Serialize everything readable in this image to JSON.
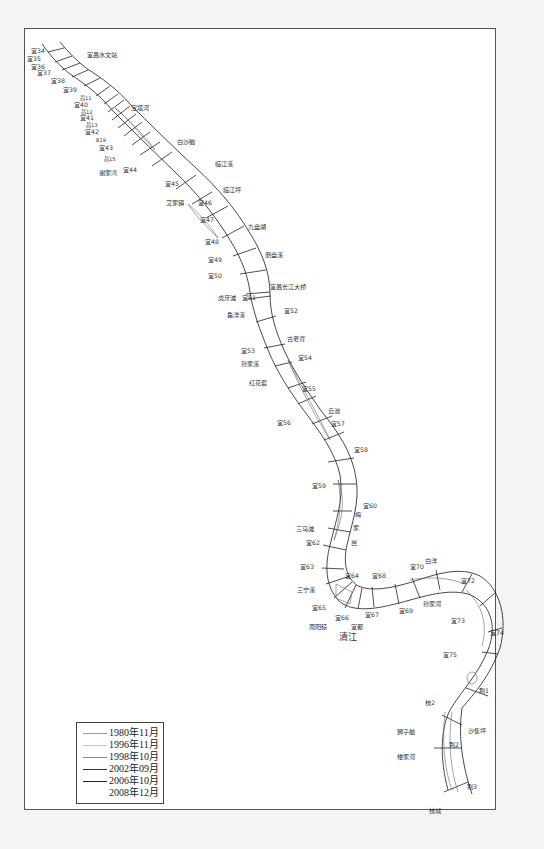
{
  "map": {
    "title": "",
    "frame_color": "#555555",
    "river_line_color": "#333333"
  },
  "sections": [
    {
      "id": "s34",
      "label": "宜34",
      "x": 31,
      "y": 53
    },
    {
      "id": "s35",
      "label": "宜35",
      "x": 27,
      "y": 61
    },
    {
      "id": "s36",
      "label": "宜36",
      "x": 31,
      "y": 69
    },
    {
      "id": "s37",
      "label": "宜37",
      "x": 37,
      "y": 75
    },
    {
      "id": "s38",
      "label": "宜38",
      "x": 51,
      "y": 83
    },
    {
      "id": "s39",
      "label": "宜39",
      "x": 63,
      "y": 92
    },
    {
      "id": "s40",
      "label": "宜40",
      "x": 74,
      "y": 107
    },
    {
      "id": "s41",
      "label": "宜41",
      "x": 80,
      "y": 120
    },
    {
      "id": "s42",
      "label": "宜42",
      "x": 85,
      "y": 134
    },
    {
      "id": "s43",
      "label": "宜43",
      "x": 99,
      "y": 150
    },
    {
      "id": "s44",
      "label": "宜44",
      "x": 123,
      "y": 172
    },
    {
      "id": "s45",
      "label": "宜45",
      "x": 165,
      "y": 186
    },
    {
      "id": "s46",
      "label": "宜46",
      "x": 198,
      "y": 205
    },
    {
      "id": "s47",
      "label": "宜47",
      "x": 200,
      "y": 222
    },
    {
      "id": "s48",
      "label": "宜48",
      "x": 205,
      "y": 244
    },
    {
      "id": "s49",
      "label": "宜49",
      "x": 208,
      "y": 262
    },
    {
      "id": "s50",
      "label": "宜50",
      "x": 208,
      "y": 278
    },
    {
      "id": "s51",
      "label": "宜51",
      "x": 242,
      "y": 300
    },
    {
      "id": "s52",
      "label": "宜52",
      "x": 284,
      "y": 313
    },
    {
      "id": "s53",
      "label": "宜53",
      "x": 241,
      "y": 353
    },
    {
      "id": "s54",
      "label": "宜54",
      "x": 298,
      "y": 360
    },
    {
      "id": "s55",
      "label": "宜55",
      "x": 302,
      "y": 391
    },
    {
      "id": "s56",
      "label": "宜56",
      "x": 277,
      "y": 425
    },
    {
      "id": "s57",
      "label": "宜57",
      "x": 331,
      "y": 426
    },
    {
      "id": "s58",
      "label": "宜58",
      "x": 354,
      "y": 452
    },
    {
      "id": "s59",
      "label": "宜59",
      "x": 312,
      "y": 488
    },
    {
      "id": "s60",
      "label": "宜60",
      "x": 363,
      "y": 508
    },
    {
      "id": "s62",
      "label": "宜62",
      "x": 306,
      "y": 545
    },
    {
      "id": "s63",
      "label": "宜63",
      "x": 300,
      "y": 569
    },
    {
      "id": "s64",
      "label": "宜64",
      "x": 345,
      "y": 578
    },
    {
      "id": "s65",
      "label": "宜65",
      "x": 312,
      "y": 610
    },
    {
      "id": "s66",
      "label": "宜66",
      "x": 335,
      "y": 620
    },
    {
      "id": "s67",
      "label": "宜67",
      "x": 365,
      "y": 617
    },
    {
      "id": "s68",
      "label": "宜68",
      "x": 372,
      "y": 578
    },
    {
      "id": "s69",
      "label": "宜69",
      "x": 399,
      "y": 613
    },
    {
      "id": "s70",
      "label": "宜70",
      "x": 410,
      "y": 569
    },
    {
      "id": "s72",
      "label": "宜72",
      "x": 461,
      "y": 583
    },
    {
      "id": "s73",
      "label": "宜73",
      "x": 451,
      "y": 623
    },
    {
      "id": "s74",
      "label": "宜74",
      "x": 490,
      "y": 635
    },
    {
      "id": "s75",
      "label": "宜75",
      "x": 443,
      "y": 657
    },
    {
      "id": "j1",
      "label": "荆1",
      "x": 479,
      "y": 693
    },
    {
      "id": "z2",
      "label": "枝2",
      "x": 425,
      "y": 705
    },
    {
      "id": "j2",
      "label": "荆2",
      "x": 449,
      "y": 747
    },
    {
      "id": "j3",
      "label": "荆3",
      "x": 467,
      "y": 789
    }
  ],
  "small_sections": [
    {
      "label": "昌11",
      "x": 80,
      "y": 100
    },
    {
      "label": "昌12",
      "x": 81,
      "y": 114
    },
    {
      "label": "昌13",
      "x": 86,
      "y": 127
    },
    {
      "label": "昌15",
      "x": 104,
      "y": 161
    },
    {
      "label": "B19",
      "x": 96,
      "y": 142
    }
  ],
  "places": [
    {
      "label": "宜昌水文站",
      "x": 87,
      "y": 57
    },
    {
      "label": "宝塔河",
      "x": 131,
      "y": 110
    },
    {
      "label": "白沙脑",
      "x": 177,
      "y": 144
    },
    {
      "label": "谢家湾",
      "x": 99,
      "y": 175
    },
    {
      "label": "临江溪",
      "x": 215,
      "y": 166
    },
    {
      "label": "临江坪",
      "x": 223,
      "y": 192
    },
    {
      "label": "艾家镇",
      "x": 166,
      "y": 205
    },
    {
      "label": "九盘湖",
      "x": 248,
      "y": 229
    },
    {
      "label": "磨盘溪",
      "x": 265,
      "y": 257
    },
    {
      "label": "宜昌长江大桥",
      "x": 270,
      "y": 289
    },
    {
      "label": "虎牙滩",
      "x": 218,
      "y": 300
    },
    {
      "label": "鱼洋溪",
      "x": 227,
      "y": 317
    },
    {
      "label": "古老背",
      "x": 287,
      "y": 341
    },
    {
      "label": "孙家溪",
      "x": 241,
      "y": 366
    },
    {
      "label": "红花套",
      "x": 249,
      "y": 385
    },
    {
      "label": "云池",
      "x": 328,
      "y": 413
    },
    {
      "label": "三马滩",
      "x": 296,
      "y": 531
    },
    {
      "label": "三宁溪",
      "x": 297,
      "y": 592
    },
    {
      "label": "南阳碛",
      "x": 309,
      "y": 629
    },
    {
      "label": "宜都",
      "x": 351,
      "y": 629
    },
    {
      "label": "白洋",
      "x": 425,
      "y": 563
    },
    {
      "label": "孙家河",
      "x": 423,
      "y": 606
    },
    {
      "label": "狮子脑",
      "x": 397,
      "y": 734
    },
    {
      "label": "沙集坪",
      "x": 468,
      "y": 733
    },
    {
      "label": "楼家河",
      "x": 397,
      "y": 759
    },
    {
      "label": "枝城",
      "x": 429,
      "y": 813
    }
  ],
  "vertical_labels": [
    {
      "label": "梅",
      "x": 355,
      "y": 517
    },
    {
      "label": "家",
      "x": 353,
      "y": 530
    },
    {
      "label": "岂",
      "x": 351,
      "y": 545
    }
  ],
  "water_labels": [
    {
      "label": "清江",
      "x": 339,
      "y": 640
    }
  ],
  "legend": {
    "items": [
      {
        "label": "1980年11月",
        "color": "#9a9a9a",
        "width": 0.6
      },
      {
        "label": "1996年11月",
        "color": "#b5b5b5",
        "width": 0.6
      },
      {
        "label": "1998年10月",
        "color": "#8c8c8c",
        "width": 0.8
      },
      {
        "label": "2002年09月",
        "color": "#333333",
        "width": 1.0
      },
      {
        "label": "2006年10月",
        "color": "#222222",
        "width": 1.2
      },
      {
        "label": "2008年12月",
        "color": "#ffffff",
        "width": 0.8
      }
    ]
  }
}
